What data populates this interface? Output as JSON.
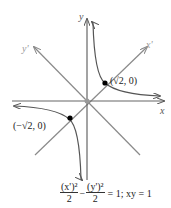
{
  "diagram": {
    "axes": {
      "x_label": "x",
      "y_label": "y",
      "x_rot_label": "x'",
      "y_rot_label": "y'"
    },
    "points": [
      {
        "label": "(√2, 0)",
        "x": 1,
        "y": 1
      },
      {
        "label": "(−√2, 0)",
        "x": -1,
        "y": -1
      }
    ],
    "curve": "xy = 1",
    "caption": {
      "frac1_num": "(x')²",
      "frac1_den": "2",
      "minus": "−",
      "frac2_num": "(y')²",
      "frac2_den": "2",
      "rest": "= 1; xy = 1"
    },
    "colors": {
      "axis": "#555555",
      "diag": "#8a8a8a",
      "curve": "#555555",
      "point": "#000000"
    }
  }
}
